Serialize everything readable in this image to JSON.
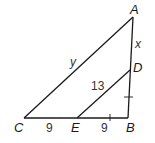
{
  "diagram": {
    "type": "triangle-with-parallel-segment",
    "points": {
      "A": {
        "label": "A",
        "x": 133,
        "y": 17
      },
      "B": {
        "label": "B",
        "x": 128,
        "y": 118
      },
      "C": {
        "label": "C",
        "x": 24,
        "y": 118
      },
      "D": {
        "label": "D",
        "x": 130,
        "y": 70
      },
      "E": {
        "label": "E",
        "x": 77,
        "y": 118
      }
    },
    "segments": [
      {
        "from": "A",
        "to": "C",
        "label": "y"
      },
      {
        "from": "A",
        "to": "D",
        "label": "x"
      },
      {
        "from": "D",
        "to": "B",
        "tick": true
      },
      {
        "from": "C",
        "to": "E",
        "label": "9"
      },
      {
        "from": "E",
        "to": "B",
        "label": "9",
        "tick": true
      },
      {
        "from": "D",
        "to": "E",
        "label": "13"
      }
    ],
    "colors": {
      "stroke": "#1a1a1a",
      "text": "#333333",
      "background": "#ffffff"
    }
  },
  "labels": {
    "A": "A",
    "B": "B",
    "C": "C",
    "D": "D",
    "E": "E",
    "x": "x",
    "y": "y",
    "DE": "13",
    "CE": "9",
    "EB": "9"
  }
}
